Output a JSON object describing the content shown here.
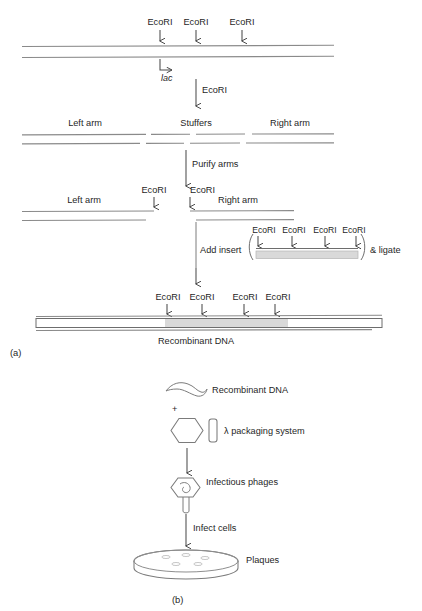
{
  "figure": {
    "panel_a_label": "(a)",
    "panel_b_label": "(b)"
  },
  "panel_a": {
    "vector_sites": [
      {
        "label": "EcoRI"
      },
      {
        "label": "EcoRI"
      },
      {
        "label": "EcoRI"
      }
    ],
    "promoter_label": "lac",
    "digest_step_label": "EcoRI",
    "fragments": [
      {
        "label": "Left arm"
      },
      {
        "label": "Stuffers"
      },
      {
        "label": "Right arm"
      }
    ],
    "purify_step_label": "Purify arms",
    "arms": [
      {
        "label": "Left arm",
        "site_label": "EcoRI"
      },
      {
        "label": "Right arm",
        "site_label": "EcoRI"
      }
    ],
    "insert_step_label": "Add insert",
    "ligate_label": "& ligate",
    "insert_sites": [
      {
        "label": "EcoRI"
      },
      {
        "label": "EcoRI"
      },
      {
        "label": "EcoRI"
      },
      {
        "label": "EcoRI"
      }
    ],
    "recombinant_sites": [
      {
        "label": "EcoRI"
      },
      {
        "label": "EcoRI"
      },
      {
        "label": "EcoRI"
      },
      {
        "label": "EcoRI"
      }
    ],
    "recombinant_label": "Recombinant DNA"
  },
  "panel_b": {
    "dna_label": "Recombinant DNA",
    "plus_symbol": "+",
    "packaging_label": "λ packaging system",
    "phage_label": "Infectious phages",
    "infect_label": "Infect cells",
    "plaques_label": "Plaques"
  },
  "colors": {
    "insert_shade": "#d9d9d9",
    "strand": "#8a8a8a",
    "arrow": "#4a4a4a",
    "text": "#1f1f1f"
  }
}
